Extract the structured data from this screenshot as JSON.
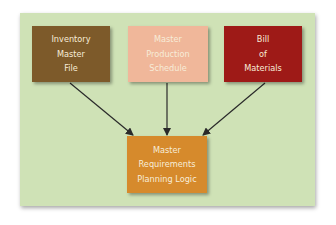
{
  "diagram": {
    "nodes": [
      {
        "id": "inventory-master-file",
        "lines": [
          "Inventory",
          "Master",
          "File"
        ],
        "color": "#7d5a2a"
      },
      {
        "id": "master-production-schedule",
        "lines": [
          "Master",
          "Production",
          "Schedule"
        ],
        "color": "#f0b79a"
      },
      {
        "id": "bill-of-materials",
        "lines": [
          "Bill",
          "of",
          "Materials"
        ],
        "color": "#9e1a17"
      },
      {
        "id": "master-requirements-planning-logic",
        "lines": [
          "Master",
          "Requirements",
          "Planning Logic"
        ],
        "color": "#d68a2c"
      }
    ],
    "edges": [
      {
        "from": "inventory-master-file",
        "to": "master-requirements-planning-logic"
      },
      {
        "from": "master-production-schedule",
        "to": "master-requirements-planning-logic"
      },
      {
        "from": "bill-of-materials",
        "to": "master-requirements-planning-logic"
      }
    ],
    "background_color": "#cfe2b6",
    "arrow_color": "#2a2a2a"
  }
}
